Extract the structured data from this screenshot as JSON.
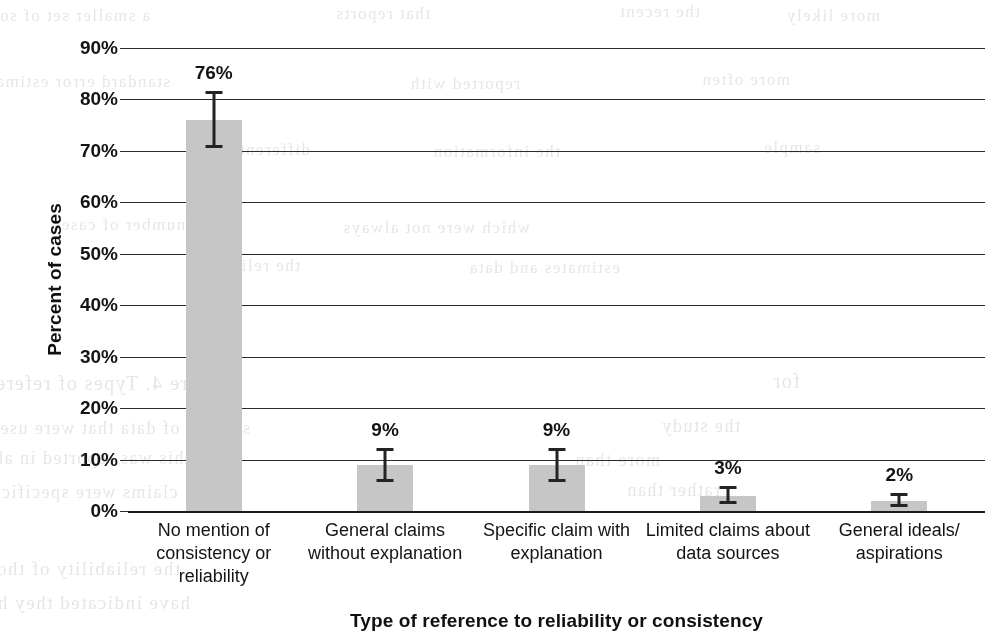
{
  "chart_data": {
    "type": "bar",
    "title": "",
    "xlabel": "Type of reference to reliability or consistency",
    "ylabel": "Percent of cases",
    "categories": [
      "No mention of consistency or reliability",
      "General claims without explanation",
      "Specific claim with explanation",
      "Limited claims about data sources",
      "General ideals/ aspirations"
    ],
    "category_lines": [
      [
        "No mention of",
        "consistency or",
        "reliability"
      ],
      [
        "General claims",
        "without explanation"
      ],
      [
        "Specific claim with",
        "explanation"
      ],
      [
        "Limited claims about",
        "data sources"
      ],
      [
        "General ideals/",
        "aspirations"
      ]
    ],
    "values": [
      76,
      9,
      9,
      3,
      2
    ],
    "value_labels": [
      "76%",
      "9%",
      "9%",
      "3%",
      "2%"
    ],
    "error_low": [
      71.0,
      6.0,
      6.0,
      1.8,
      1.2
    ],
    "error_high": [
      81.5,
      12.0,
      12.0,
      4.6,
      3.4
    ],
    "ylim": [
      0,
      90
    ],
    "ytick_values": [
      0,
      10,
      20,
      30,
      40,
      50,
      60,
      70,
      80,
      90
    ],
    "ytick_labels": [
      "0%",
      "10%",
      "20%",
      "30%",
      "40%",
      "50%",
      "60%",
      "70%",
      "80%",
      "90%"
    ],
    "grid": true,
    "legend": "none",
    "bar_color": "#c6c6c6",
    "bar_edge_color": "#c6c6c6",
    "error_color": "#232323",
    "gridline_color": "#2b2b2b",
    "axis_color": "#1b1b1b",
    "text_color": "#141414",
    "background_color": "#ffffff"
  },
  "bleed_text": {
    "lines": [
      {
        "text": "a smaller set of sources",
        "x": 150,
        "y": 6,
        "size": 17
      },
      {
        "text": "that reports",
        "x": 430,
        "y": 4,
        "size": 17
      },
      {
        "text": "the recent",
        "x": 700,
        "y": 2,
        "size": 17
      },
      {
        "text": "more likely",
        "x": 880,
        "y": 6,
        "size": 17
      },
      {
        "text": "standard error estimate",
        "x": 170,
        "y": 72,
        "size": 17
      },
      {
        "text": "reported with",
        "x": 520,
        "y": 74,
        "size": 17
      },
      {
        "text": "more often",
        "x": 790,
        "y": 70,
        "size": 17
      },
      {
        "text": "different",
        "x": 310,
        "y": 140,
        "size": 17
      },
      {
        "text": "the information",
        "x": 560,
        "y": 142,
        "size": 17
      },
      {
        "text": "sample",
        "x": 820,
        "y": 138,
        "size": 17
      },
      {
        "text": "a number of cases",
        "x": 200,
        "y": 215,
        "size": 17
      },
      {
        "text": "which were not always",
        "x": 530,
        "y": 218,
        "size": 17
      },
      {
        "text": "the reliability",
        "x": 300,
        "y": 256,
        "size": 17
      },
      {
        "text": "estimates and data",
        "x": 620,
        "y": 258,
        "size": 17
      },
      {
        "text": "Figure 4. Types of reference to reliability in the",
        "x": 230,
        "y": 372,
        "size": 20
      },
      {
        "text": "for",
        "x": 800,
        "y": 370,
        "size": 20
      },
      {
        "text": "sources of data that were used",
        "x": 250,
        "y": 418,
        "size": 18
      },
      {
        "text": "the study",
        "x": 740,
        "y": 416,
        "size": 18
      },
      {
        "text": "this was reported in about",
        "x": 190,
        "y": 448,
        "size": 18
      },
      {
        "text": "more than",
        "x": 660,
        "y": 450,
        "size": 18
      },
      {
        "text": "the claims were specific and often",
        "x": 210,
        "y": 482,
        "size": 18
      },
      {
        "text": "rather than",
        "x": 720,
        "y": 480,
        "size": 18
      },
      {
        "text": "the reliability of those data is not",
        "x": 180,
        "y": 558,
        "size": 19
      },
      {
        "text": "have indicated they have identified that result is",
        "x": 190,
        "y": 592,
        "size": 19
      }
    ]
  }
}
